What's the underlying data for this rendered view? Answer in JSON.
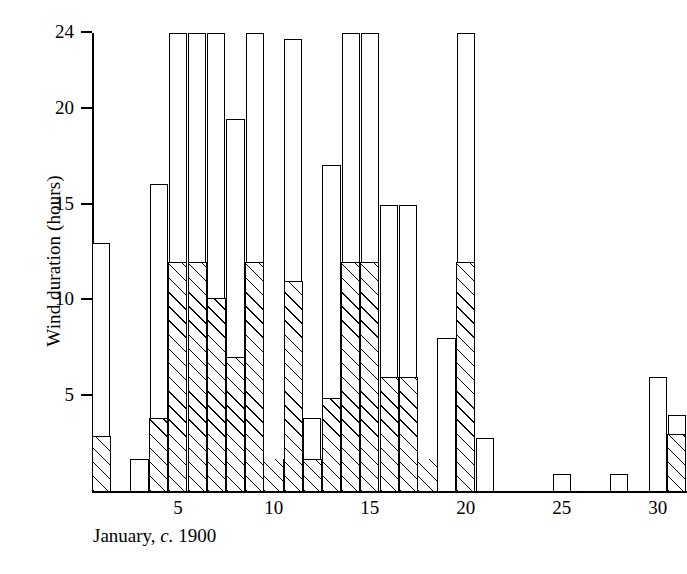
{
  "chart_data": {
    "type": "bar",
    "title": "",
    "subtitle": "",
    "xlabel": "January, c. 1900",
    "ylabel": "Wind duration (hours)",
    "grid": false,
    "legend": "none",
    "stacked": true,
    "xlim": [
      0.5,
      31.5
    ],
    "ylim": [
      0,
      24
    ],
    "ytick_labels": [
      "24",
      "20",
      "15",
      "10",
      "5"
    ],
    "yticks": [
      24,
      20,
      15,
      10,
      5
    ],
    "xtick_labels": [
      "5",
      "10",
      "15",
      "20",
      "25",
      "30"
    ],
    "xticks": [
      5,
      10,
      15,
      20,
      25,
      30
    ],
    "categories": [
      1,
      2,
      3,
      4,
      5,
      6,
      7,
      8,
      9,
      10,
      11,
      12,
      13,
      14,
      15,
      16,
      17,
      18,
      19,
      20,
      21,
      22,
      23,
      24,
      25,
      26,
      27,
      28,
      29,
      30,
      31
    ],
    "series": [
      {
        "name": "hatched",
        "values": [
          2.9,
          0,
          0,
          3.8,
          12,
          12,
          10.1,
          7,
          12,
          1.7,
          11,
          1.7,
          4.9,
          12,
          12,
          6,
          6,
          1.7,
          0,
          12,
          0,
          0,
          0,
          0,
          0,
          0,
          0,
          0,
          0,
          0,
          3
        ]
      },
      {
        "name": "open",
        "values": [
          13,
          0,
          1.7,
          16.1,
          24,
          24,
          24,
          19.5,
          24,
          1.7,
          23.7,
          3.8,
          17.1,
          24,
          24,
          15,
          15,
          1.7,
          8,
          24,
          2.8,
          0,
          0,
          0,
          0.9,
          0,
          0,
          0.9,
          0,
          6,
          4
        ]
      }
    ],
    "annotations": []
  },
  "axis": {
    "caption_prefix": "January,",
    "caption_italic": "c.",
    "caption_year": "1900"
  }
}
